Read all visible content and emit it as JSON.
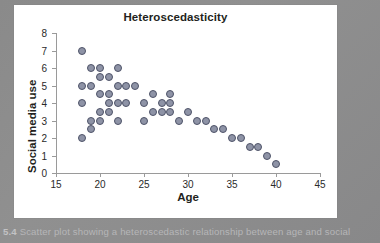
{
  "caption": {
    "number": "5.4",
    "text": "Scatter plot showing a heteroscedastic relationship between age and social"
  },
  "chart_data": {
    "type": "scatter",
    "title": "Heteroscedasticity",
    "xlabel": "Age",
    "ylabel": "Social media use",
    "xlim": [
      15,
      45
    ],
    "ylim": [
      0,
      8
    ],
    "xticks": [
      15,
      20,
      25,
      30,
      35,
      40,
      45
    ],
    "yticks": [
      0,
      1,
      2,
      3,
      4,
      5,
      6,
      7,
      8
    ],
    "grid": false,
    "legend": null,
    "marker_color": "#8e93a6",
    "marker_edge_color": "#4e5368",
    "points": [
      [
        18,
        7
      ],
      [
        18,
        5
      ],
      [
        18,
        4
      ],
      [
        18,
        2
      ],
      [
        19,
        6
      ],
      [
        19,
        5
      ],
      [
        19,
        3
      ],
      [
        19,
        2.5
      ],
      [
        20,
        6
      ],
      [
        20,
        5.5
      ],
      [
        20,
        4.5
      ],
      [
        20,
        3.5
      ],
      [
        20,
        3
      ],
      [
        21,
        5.5
      ],
      [
        21,
        4.5
      ],
      [
        21,
        3.5
      ],
      [
        21,
        4
      ],
      [
        22,
        6
      ],
      [
        22,
        5
      ],
      [
        22,
        4
      ],
      [
        22,
        3
      ],
      [
        23,
        5
      ],
      [
        23,
        4
      ],
      [
        24,
        5
      ],
      [
        25,
        4
      ],
      [
        25,
        3
      ],
      [
        26,
        4.5
      ],
      [
        26,
        3.5
      ],
      [
        27,
        4
      ],
      [
        27,
        3.5
      ],
      [
        28,
        4.5
      ],
      [
        28,
        3.5
      ],
      [
        28,
        4
      ],
      [
        29,
        3
      ],
      [
        30,
        3.5
      ],
      [
        31,
        3
      ],
      [
        32,
        3
      ],
      [
        33,
        2.5
      ],
      [
        34,
        2.5
      ],
      [
        35,
        2
      ],
      [
        36,
        2
      ],
      [
        37,
        1.5
      ],
      [
        38,
        1.5
      ],
      [
        39,
        1
      ],
      [
        40,
        0.5
      ]
    ]
  }
}
